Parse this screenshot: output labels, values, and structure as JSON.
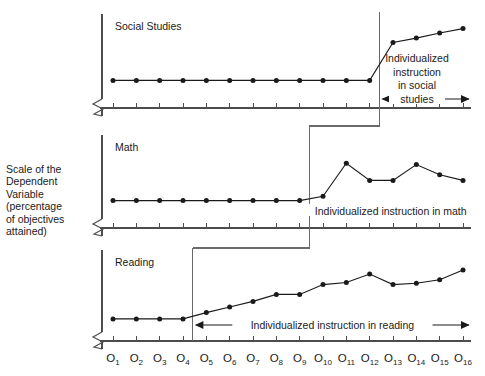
{
  "figure": {
    "y_axis_label": "Scale of the\nDependent\nVariable\n(percentage\nof objectives\nattained)",
    "panels": [
      {
        "key": "social_studies",
        "title": "Social Studies",
        "annotation": "Individualized\ninstruction\nin social\nstudies"
      },
      {
        "key": "math",
        "title": "Math",
        "annotation": "Individualized instruction in math"
      },
      {
        "key": "reading",
        "title": "Reading",
        "annotation": "Individualized instruction in reading"
      }
    ],
    "x_tick_base": "O",
    "x_tick_subscripts": [
      "1",
      "2",
      "3",
      "4",
      "5",
      "6",
      "7",
      "8",
      "9",
      "10",
      "11",
      "12",
      "13",
      "14",
      "15",
      "16"
    ],
    "colors": {
      "line": "#1a1a1a",
      "marker": "#1a1a1a",
      "axis": "#4d4d4d",
      "phase_line": "#6a6a6a",
      "connector": "#6a6a6a",
      "text": "#1a1a1a"
    }
  },
  "chart_data": {
    "type": "line",
    "xlabel": "",
    "ylabel": "Scale of the Dependent Variable (percentage of objectives attained)",
    "x": [
      "O1",
      "O2",
      "O3",
      "O4",
      "O5",
      "O6",
      "O7",
      "O8",
      "O9",
      "O10",
      "O11",
      "O12",
      "O13",
      "O14",
      "O15",
      "O16"
    ],
    "ylim": [
      0,
      100
    ],
    "grid": false,
    "legend": "none",
    "panel_layout": "stacked-3",
    "series": [
      {
        "name": "Social Studies",
        "panel": 1,
        "intervention_after": "O12",
        "baseline_phase": [
          "O1",
          "O2",
          "O3",
          "O4",
          "O5",
          "O6",
          "O7",
          "O8",
          "O9",
          "O10",
          "O11",
          "O12"
        ],
        "treatment_phase": [
          "O13",
          "O14",
          "O15",
          "O16"
        ],
        "values": [
          20,
          20,
          20,
          20,
          20,
          20,
          20,
          20,
          20,
          20,
          20,
          20,
          72,
          78,
          85,
          91
        ],
        "annotation": "Individualized instruction in social studies"
      },
      {
        "name": "Math",
        "panel": 2,
        "intervention_after": "O9",
        "baseline_phase": [
          "O1",
          "O2",
          "O3",
          "O4",
          "O5",
          "O6",
          "O7",
          "O8",
          "O9"
        ],
        "treatment_phase": [
          "O10",
          "O11",
          "O12",
          "O13",
          "O14",
          "O15",
          "O16"
        ],
        "values": [
          20,
          20,
          20,
          20,
          20,
          20,
          20,
          20,
          20,
          26,
          72,
          48,
          48,
          70,
          56,
          48
        ],
        "annotation": "Individualized instruction in math"
      },
      {
        "name": "Reading",
        "panel": 3,
        "intervention_after": "O4",
        "baseline_phase": [
          "O1",
          "O2",
          "O3",
          "O4"
        ],
        "treatment_phase": [
          "O5",
          "O6",
          "O7",
          "O8",
          "O9",
          "O10",
          "O11",
          "O12",
          "O13",
          "O14",
          "O15",
          "O16"
        ],
        "values": [
          13,
          13,
          13,
          13,
          22,
          30,
          38,
          48,
          48,
          62,
          65,
          77,
          62,
          64,
          69,
          83
        ],
        "annotation": "Individualized instruction in reading"
      }
    ]
  }
}
